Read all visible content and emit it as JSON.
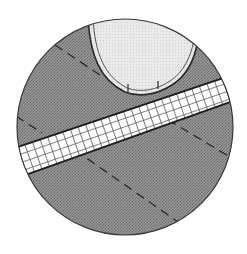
{
  "diagram": {
    "type": "circular-detail-illustration",
    "canvas": {
      "width": 247,
      "height": 254
    },
    "colors": {
      "background": "#ffffff",
      "fabric_fill": "#8e8e8e",
      "fabric_texture": "#6f6f6f",
      "band_fill": "#ffffff",
      "band_grid": "#555555",
      "oval_fill": "#e6e6e6",
      "outline": "#2a2a2a"
    },
    "elements": {
      "circle": {
        "cx": 125,
        "cy": 127,
        "r": 108
      },
      "band": {
        "top_edge": [
          [
            10,
            150
          ],
          [
            240,
            72
          ]
        ],
        "bottom_edge": [
          [
            10,
            180
          ],
          [
            240,
            98
          ]
        ]
      },
      "oval_piece": {
        "label": ""
      },
      "dashed_lines": 3
    }
  }
}
